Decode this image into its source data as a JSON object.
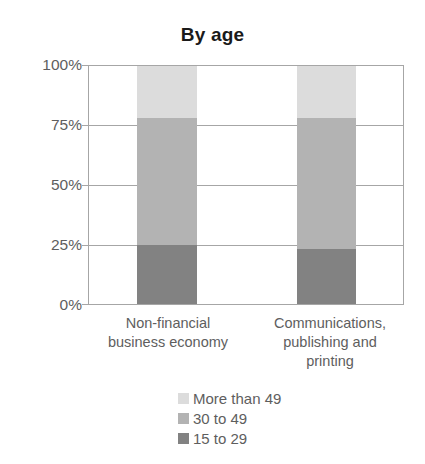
{
  "chart_data": {
    "type": "bar",
    "subtype": "stacked-percentage",
    "title": "By age",
    "xlabel": "",
    "ylabel": "",
    "ylim": [
      0,
      100
    ],
    "grid": true,
    "legend_position": "bottom",
    "categories": [
      "Non-financial business economy",
      "Communications, publishing and printing"
    ],
    "ytick_labels": [
      "100%",
      "75%",
      "50%",
      "25%",
      "0%"
    ],
    "ytick_values": [
      100,
      75,
      50,
      25,
      0
    ],
    "series": [
      {
        "name": "More than 49",
        "color": "#dcdcdc",
        "values": [
          22,
          22
        ]
      },
      {
        "name": "30 to 49",
        "color": "#b3b3b3",
        "values": [
          53,
          55
        ]
      },
      {
        "name": "15 to 29",
        "color": "#828282",
        "values": [
          25,
          23
        ]
      }
    ]
  },
  "axis": {
    "tick_0": "100%",
    "tick_1": "75%",
    "tick_2": "50%",
    "tick_3": "25%",
    "tick_4": "0%"
  },
  "categories": {
    "cat_0_line_1": "Non-financial",
    "cat_0_line_2": "business economy",
    "cat_1_line_1": "Communications,",
    "cat_1_line_2": "publishing and",
    "cat_1_line_3": "printing"
  },
  "legend": {
    "item_0": "More than 49",
    "item_1": "30 to 49",
    "item_2": "15 to 29"
  }
}
